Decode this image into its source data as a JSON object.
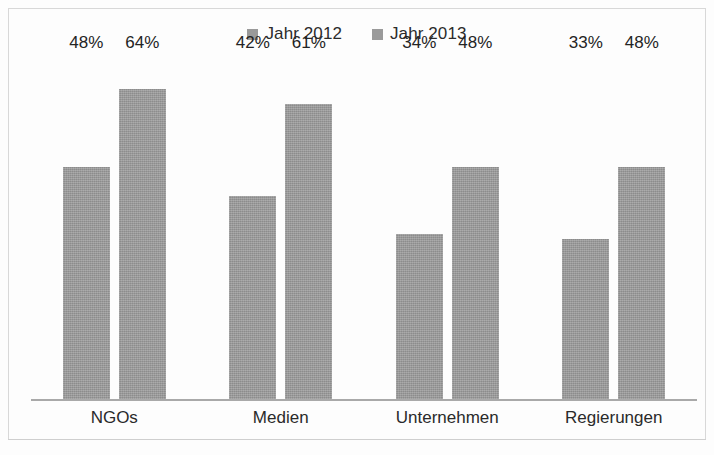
{
  "legend": {
    "position": "top-center",
    "entries": [
      {
        "label": "Jahr 2012",
        "color": "#9a9a9a"
      },
      {
        "label": "Jahr 2013",
        "color": "#9a9a9a"
      }
    ]
  },
  "axis": {
    "categories": [
      "NGOs",
      "Medien",
      "Unternehmen",
      "Regierungen"
    ]
  },
  "labels": {
    "ngos_2012": "48%",
    "ngos_2013": "64%",
    "medien_2012": "42%",
    "medien_2013": "61%",
    "unternehmen_2012": "34%",
    "unternehmen_2013": "48%",
    "regierungen_2012": "33%",
    "regierungen_2013": "48%"
  },
  "chart_data": {
    "type": "bar",
    "title": "",
    "subtitle": "",
    "xlabel": "",
    "ylabel": "",
    "categories": [
      "NGOs",
      "Medien",
      "Unternehmen",
      "Regierungen"
    ],
    "series": [
      {
        "name": "Jahr 2012",
        "values": [
          48,
          42,
          34,
          33
        ],
        "color": "#9a9a9a"
      },
      {
        "name": "Jahr 2013",
        "values": [
          64,
          61,
          48,
          48
        ],
        "color": "#9a9a9a"
      }
    ],
    "value_labels": [
      [
        "48%",
        "42%",
        "34%",
        "33%"
      ],
      [
        "64%",
        "61%",
        "48%",
        "48%"
      ]
    ],
    "value_suffix": "%",
    "ylim": [
      0,
      70
    ],
    "grid": false,
    "y_axis_visible": false,
    "x_axis_visible": true,
    "legend_position": "top-center",
    "grouping": "grouped"
  }
}
